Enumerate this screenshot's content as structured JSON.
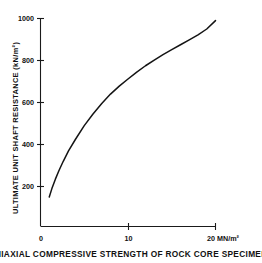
{
  "chart_data": {
    "type": "line",
    "title": "",
    "xlabel": "UNIAXIAL COMPRESSIVE STRENGTH OF ROCK CORE SPECIMENS",
    "xunits": "20 MN/m²",
    "ylabel": "ULTIMATE UNIT SHAFT RESISTANCE  (kN/m²)",
    "xlim": [
      0,
      20
    ],
    "ylim": [
      0,
      1000
    ],
    "grid": false,
    "legend": "none",
    "xticks": [
      {
        "value": 0,
        "label": "0"
      },
      {
        "value": 10,
        "label": "10"
      },
      {
        "value": 20,
        "label": "20"
      }
    ],
    "yticks": [
      {
        "value": 200,
        "label": "200"
      },
      {
        "value": 400,
        "label": "400"
      },
      {
        "value": 600,
        "label": "600"
      },
      {
        "value": 800,
        "label": "800"
      },
      {
        "value": 1000,
        "label": "1000"
      }
    ],
    "series": [
      {
        "name": "ultimate unit shaft resistance",
        "x": [
          1.0,
          1.3,
          1.7,
          2.1,
          2.6,
          3.2,
          4.0,
          5.0,
          6.0,
          7.0,
          8.0,
          9.0,
          10.0,
          11.0,
          12.0,
          13.0,
          14.0,
          15.0,
          16.0,
          17.0,
          18.0,
          19.0,
          20.0
        ],
        "y": [
          150,
          190,
          235,
          275,
          320,
          370,
          425,
          490,
          545,
          595,
          640,
          678,
          712,
          745,
          775,
          802,
          828,
          852,
          875,
          898,
          922,
          950,
          990
        ]
      }
    ]
  },
  "axis_titles": {
    "y_title": "ULTIMATE UNIT SHAFT RESISTANCE  (kN/m²)",
    "x_caption": "UNIAXIAL COMPRESSIVE STRENGTH OF ROCK CORE SPECIMENS",
    "x_units_label": "20 MN/m²"
  }
}
